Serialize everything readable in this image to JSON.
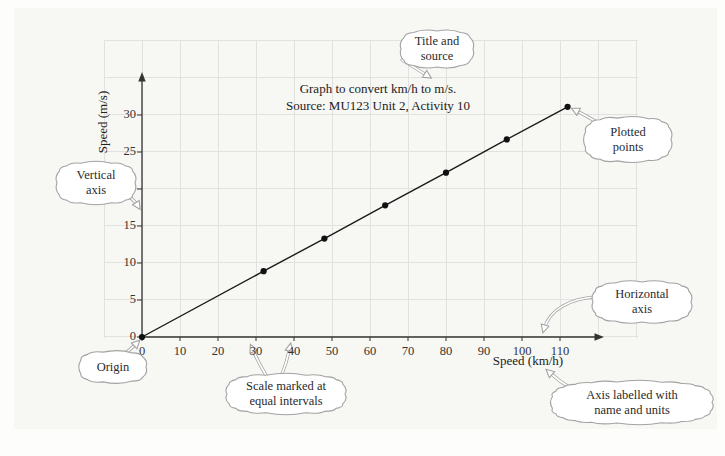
{
  "figure": {
    "title": "Graph to convert km/h to m/s.",
    "source": "Source: MU123 Unit 2, Activity 10",
    "x_axis_label": "Speed (km/h)",
    "y_axis_label": "Speed (m/s)"
  },
  "chart_data": {
    "type": "line",
    "title": "Graph to convert km/h to m/s.",
    "subtitle": "Source: MU123 Unit 2, Activity 10",
    "xlabel": "Speed (km/h)",
    "ylabel": "Speed (m/s)",
    "x_ticks": [
      0,
      10,
      20,
      30,
      40,
      50,
      60,
      70,
      80,
      90,
      100,
      110
    ],
    "y_ticks": [
      0,
      5,
      10,
      15,
      20,
      25,
      30
    ],
    "xlim": [
      -10,
      130
    ],
    "ylim": [
      0,
      40
    ],
    "grid": true,
    "legend": false,
    "series": [
      {
        "points": [
          [
            0,
            0
          ],
          [
            32,
            8.9
          ],
          [
            48,
            13.3
          ],
          [
            64,
            17.8
          ],
          [
            80,
            22.2
          ],
          [
            96,
            26.7
          ],
          [
            112,
            31.1
          ]
        ],
        "marker": "filled-circle",
        "line": "straight"
      }
    ]
  },
  "callouts": [
    {
      "id": "title-and-source",
      "lines": [
        "Title and",
        "source"
      ]
    },
    {
      "id": "vertical-axis",
      "lines": [
        "Vertical",
        "axis"
      ]
    },
    {
      "id": "plotted-points",
      "lines": [
        "Plotted",
        "points"
      ]
    },
    {
      "id": "origin",
      "lines": [
        "Origin"
      ]
    },
    {
      "id": "scale-equal-intervals",
      "lines": [
        "Scale marked at",
        "equal intervals"
      ]
    },
    {
      "id": "horizontal-axis",
      "lines": [
        "Horizontal",
        "axis"
      ]
    },
    {
      "id": "axis-labelled",
      "lines": [
        "Axis labelled with",
        "name and units"
      ]
    }
  ],
  "colors": {
    "panel_background": "#f7f7f4",
    "grid_line": "#e1e1df",
    "axis": "#333333",
    "data_line": "#1a1a1a",
    "data_point": "#111111",
    "callout_border": "#a3a3a3",
    "callout_fill": "#ffffff"
  }
}
